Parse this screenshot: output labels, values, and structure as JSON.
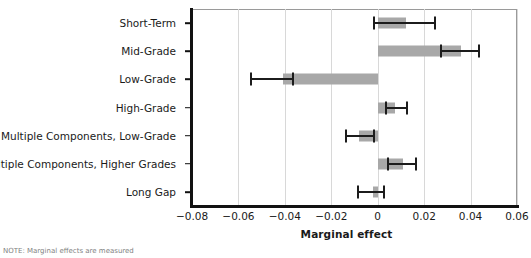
{
  "chart_data": {
    "type": "bar",
    "orientation": "horizontal",
    "title": "",
    "xlabel": "Marginal effect",
    "ylabel": "",
    "xlim": [
      -0.08,
      0.06
    ],
    "ylim": null,
    "grid": "vertical",
    "legend": null,
    "xticks": [
      "-0.08",
      "-0.06",
      "-0.04",
      "-0.02",
      "0",
      "0.02",
      "0.04",
      "0.06"
    ],
    "xtick_values": [
      -0.08,
      -0.06,
      -0.04,
      -0.02,
      0,
      0.02,
      0.04,
      0.06
    ],
    "categories": [
      "Short-Term",
      "Mid-Grade",
      "Low-Grade",
      "High-Grade",
      "Multiple Components, Low-Grade",
      "Multiple Components, Higher Grades",
      "Long Gap"
    ],
    "values": [
      0.012,
      0.036,
      -0.041,
      0.0075,
      -0.008,
      0.011,
      -0.002
    ],
    "ci_low": [
      -0.002,
      0.027,
      -0.055,
      0.003,
      -0.014,
      0.004,
      -0.009
    ],
    "ci_high": [
      0.025,
      0.044,
      -0.036,
      0.013,
      -0.001,
      0.017,
      0.003
    ],
    "bar_color": "#a8a8a8",
    "error_color": "#1c1c1c",
    "grid_color": "#d8d8d8",
    "axis_color": "#111111"
  },
  "axis": {
    "x_title": "Marginal effect"
  },
  "footnote": {
    "text": "NOTE: Marginal effects are measured"
  }
}
